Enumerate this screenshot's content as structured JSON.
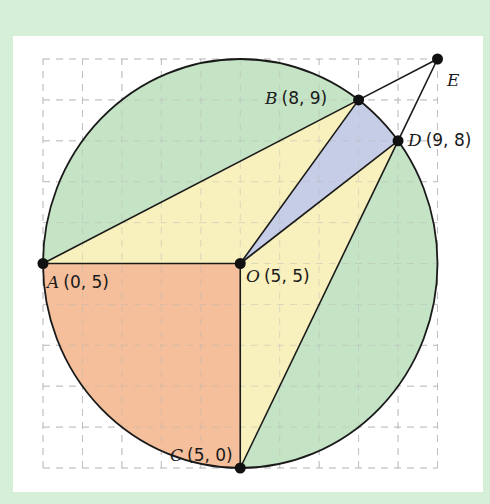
{
  "figure": {
    "type": "geometry-diagram",
    "grid": {
      "x_min": 0,
      "x_max": 10,
      "y_min": 0,
      "y_max": 10,
      "step": 1,
      "style": "dashed"
    },
    "circle": {
      "center": [
        5,
        5
      ],
      "radius": 5
    },
    "points": [
      {
        "name": "A",
        "coord_label": "(0, 5)",
        "x": 0,
        "y": 5
      },
      {
        "name": "O",
        "coord_label": "(5, 5)",
        "x": 5,
        "y": 5
      },
      {
        "name": "B",
        "coord_label": "(8, 9)",
        "x": 8,
        "y": 9
      },
      {
        "name": "D",
        "coord_label": "(9, 8)",
        "x": 9,
        "y": 8
      },
      {
        "name": "C",
        "coord_label": "(5, 0)",
        "x": 5,
        "y": 0
      },
      {
        "name": "E",
        "coord_label": "",
        "x": 10,
        "y": 10
      }
    ],
    "regions": [
      {
        "name": "segment-AB",
        "color": "#c5e3c5"
      },
      {
        "name": "segment-DC",
        "color": "#c5e3c5"
      },
      {
        "name": "triangle-AOB",
        "color": "#f8f0bd"
      },
      {
        "name": "triangle-ODC",
        "color": "#f8f0bd"
      },
      {
        "name": "sector-OBD",
        "color": "#c6cde6"
      },
      {
        "name": "quarter-sector-AOC",
        "color": "#f4bf9a"
      }
    ],
    "segments": [
      "AB",
      "AO",
      "OC",
      "OB",
      "OD",
      "DC",
      "BE",
      "DE",
      "BD-arc"
    ]
  },
  "colors": {
    "background": "#d6efd9",
    "panel": "#ffffff",
    "green": "#c5e3c5",
    "yellow": "#f8f0bd",
    "blue": "#c6cde6",
    "orange": "#f4bf9a",
    "stroke": "#1a1a1a",
    "grid": "#b8b8b8"
  }
}
